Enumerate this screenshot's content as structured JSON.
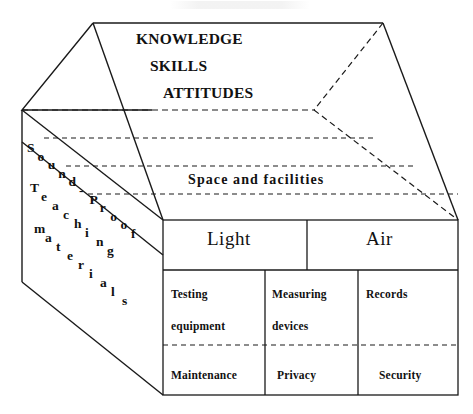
{
  "diagram": {
    "type": "house-schematic",
    "roof": {
      "lines": [
        {
          "text": "KNOWLEDGE"
        },
        {
          "text": "SKILLS"
        },
        {
          "text": "ATTITUDES"
        }
      ]
    },
    "attic": {
      "label": "Space and facilities"
    },
    "left_wall": {
      "labels": [
        {
          "text": "Sound-Proof"
        },
        {
          "text": "Teaching"
        },
        {
          "text": "materials"
        }
      ]
    },
    "table": {
      "header_row": [
        {
          "label": "Light"
        },
        {
          "label": "Air"
        }
      ],
      "middle_row": [
        {
          "line1": "Testing",
          "line2": "equipment"
        },
        {
          "line1": "Measuring",
          "line2": "devices"
        },
        {
          "line1": "Records",
          "line2": ""
        }
      ],
      "bottom_row": [
        {
          "label": "Maintenance"
        },
        {
          "label": "Privacy"
        },
        {
          "label": "Security"
        }
      ]
    },
    "colors": {
      "ink": "#1a1a1a",
      "background": "#ffffff"
    }
  }
}
